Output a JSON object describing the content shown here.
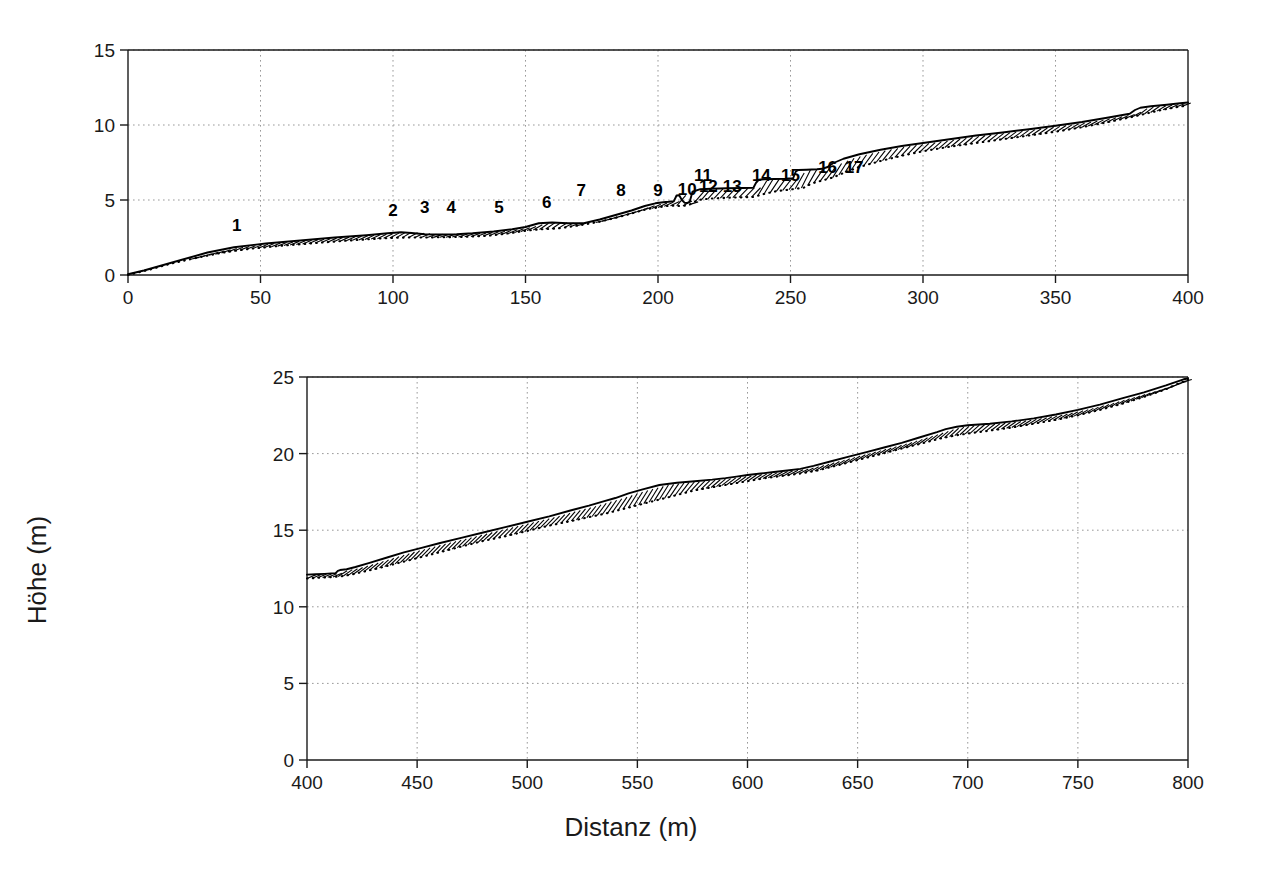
{
  "chart_data": [
    {
      "panel": "top",
      "type": "line",
      "title": "",
      "xlabel": "",
      "ylabel": "",
      "xlim": [
        0,
        400
      ],
      "ylim": [
        0,
        15
      ],
      "xticks": [
        0,
        50,
        100,
        150,
        200,
        250,
        300,
        350,
        400
      ],
      "xticklabels": [
        "0",
        "50",
        "100",
        "150",
        "200",
        "250",
        "300",
        "350",
        "400"
      ],
      "yticks": [
        0,
        5,
        10,
        15
      ],
      "yticklabels": [
        "0",
        "5",
        "10",
        "15"
      ],
      "grid": true,
      "series": [
        {
          "name": "surface-solid",
          "style": "solid",
          "x": [
            0,
            6,
            12,
            20,
            30,
            40,
            52,
            65,
            78,
            90,
            98,
            103,
            107,
            112,
            118,
            124,
            130,
            138,
            145,
            150,
            155,
            160,
            166,
            172,
            178,
            184,
            190,
            195,
            199,
            202,
            204,
            205,
            206,
            207,
            208,
            209,
            210,
            211,
            212,
            213,
            216,
            220,
            226,
            232,
            236,
            237,
            238,
            240,
            244,
            248,
            251,
            252,
            253,
            256,
            260,
            262,
            264,
            266,
            270,
            276,
            284,
            292,
            300,
            310,
            320,
            330,
            340,
            350,
            360,
            370,
            378,
            380,
            382,
            386,
            392,
            397,
            400
          ],
          "y": [
            0.05,
            0.3,
            0.6,
            1.0,
            1.5,
            1.85,
            2.1,
            2.3,
            2.5,
            2.65,
            2.78,
            2.85,
            2.8,
            2.72,
            2.7,
            2.72,
            2.78,
            2.9,
            3.05,
            3.2,
            3.45,
            3.5,
            3.45,
            3.45,
            3.7,
            4.0,
            4.3,
            4.6,
            4.78,
            4.85,
            4.88,
            4.9,
            4.92,
            5.3,
            5.32,
            5.0,
            4.82,
            4.8,
            4.9,
            5.55,
            5.72,
            5.75,
            5.78,
            5.8,
            5.82,
            6.15,
            6.35,
            6.38,
            6.4,
            6.42,
            6.45,
            6.9,
            7.0,
            7.02,
            7.05,
            7.08,
            7.2,
            7.45,
            7.75,
            8.05,
            8.35,
            8.6,
            8.8,
            9.05,
            9.3,
            9.5,
            9.72,
            9.95,
            10.2,
            10.5,
            10.75,
            11.0,
            11.15,
            11.25,
            11.35,
            11.45,
            11.5
          ]
        },
        {
          "name": "excavation-dotted",
          "style": "dotted",
          "x": [
            0,
            8,
            16,
            26,
            36,
            46,
            58,
            70,
            82,
            92,
            100,
            106,
            112,
            120,
            128,
            136,
            144,
            150,
            156,
            162,
            170,
            178,
            186,
            192,
            196,
            200,
            203,
            206,
            208,
            210,
            212,
            215,
            220,
            226,
            232,
            236,
            240,
            245,
            250,
            252,
            255,
            258,
            262,
            266,
            270,
            276,
            284,
            292,
            300,
            310,
            320,
            330,
            340,
            350,
            360,
            370,
            378,
            384,
            390,
            396,
            400
          ],
          "y": [
            0.0,
            0.35,
            0.75,
            1.15,
            1.5,
            1.75,
            1.95,
            2.12,
            2.28,
            2.4,
            2.48,
            2.5,
            2.5,
            2.52,
            2.55,
            2.62,
            2.78,
            2.95,
            3.05,
            3.1,
            3.3,
            3.55,
            3.9,
            4.2,
            4.4,
            4.5,
            4.6,
            4.62,
            4.6,
            4.62,
            4.7,
            5.0,
            5.1,
            5.15,
            5.18,
            5.2,
            5.4,
            5.6,
            5.7,
            5.75,
            5.82,
            6.1,
            6.3,
            6.5,
            6.8,
            7.2,
            7.6,
            7.95,
            8.25,
            8.55,
            8.8,
            9.05,
            9.3,
            9.55,
            9.85,
            10.2,
            10.5,
            10.75,
            11.0,
            11.2,
            11.3
          ]
        }
      ],
      "point_labels": [
        {
          "id": "1",
          "x": 41,
          "y": 2.95
        },
        {
          "id": "2",
          "x": 100,
          "y": 3.95
        },
        {
          "id": "3",
          "x": 112,
          "y": 4.15
        },
        {
          "id": "4",
          "x": 122,
          "y": 4.15
        },
        {
          "id": "5",
          "x": 140,
          "y": 4.15
        },
        {
          "id": "6",
          "x": 158,
          "y": 4.45
        },
        {
          "id": "7",
          "x": 171,
          "y": 5.3
        },
        {
          "id": "8",
          "x": 186,
          "y": 5.3
        },
        {
          "id": "9",
          "x": 200,
          "y": 5.3
        },
        {
          "id": "10",
          "x": 211,
          "y": 5.35
        },
        {
          "id": "11",
          "x": 217,
          "y": 6.3
        },
        {
          "id": "12",
          "x": 219,
          "y": 5.55
        },
        {
          "id": "13",
          "x": 228,
          "y": 5.55
        },
        {
          "id": "14",
          "x": 239,
          "y": 6.3
        },
        {
          "id": "15",
          "x": 250,
          "y": 6.3
        },
        {
          "id": "16",
          "x": 264,
          "y": 6.8
        },
        {
          "id": "17",
          "x": 274,
          "y": 6.8
        }
      ]
    },
    {
      "panel": "bottom",
      "type": "line",
      "title": "",
      "xlabel": "Distanz (m)",
      "ylabel": "Höhe (m)",
      "xlim": [
        400,
        800
      ],
      "ylim": [
        0,
        25
      ],
      "xticks": [
        400,
        450,
        500,
        550,
        600,
        650,
        700,
        750,
        800
      ],
      "xticklabels": [
        "400",
        "450",
        "500",
        "550",
        "600",
        "650",
        "700",
        "750",
        "800"
      ],
      "yticks": [
        0,
        5,
        10,
        15,
        20,
        25
      ],
      "yticklabels": [
        "0",
        "5",
        "10",
        "15",
        "20",
        "25"
      ],
      "grid": true,
      "series": [
        {
          "name": "surface-solid",
          "style": "solid",
          "x": [
            400,
            404,
            408,
            411,
            413,
            414,
            415,
            416,
            418,
            422,
            428,
            436,
            444,
            452,
            460,
            470,
            480,
            490,
            500,
            510,
            520,
            528,
            535,
            540,
            546,
            552,
            560,
            568,
            576,
            584,
            590,
            595,
            600,
            606,
            612,
            618,
            624,
            630,
            638,
            646,
            654,
            662,
            670,
            678,
            686,
            690,
            695,
            700,
            710,
            720,
            730,
            740,
            750,
            760,
            770,
            780,
            790,
            795,
            798,
            800
          ],
          "y": [
            12.1,
            12.12,
            12.15,
            12.18,
            12.2,
            12.35,
            12.4,
            12.42,
            12.45,
            12.6,
            12.85,
            13.2,
            13.55,
            13.85,
            14.15,
            14.5,
            14.85,
            15.2,
            15.55,
            15.9,
            16.3,
            16.6,
            16.9,
            17.1,
            17.4,
            17.65,
            17.95,
            18.1,
            18.2,
            18.3,
            18.4,
            18.5,
            18.6,
            18.7,
            18.8,
            18.9,
            19.0,
            19.2,
            19.5,
            19.8,
            20.1,
            20.4,
            20.7,
            21.05,
            21.4,
            21.6,
            21.75,
            21.85,
            21.95,
            22.1,
            22.3,
            22.55,
            22.85,
            23.2,
            23.6,
            24.0,
            24.45,
            24.7,
            24.85,
            24.9
          ]
        },
        {
          "name": "excavation-dotted",
          "style": "dotted",
          "x": [
            400,
            406,
            412,
            416,
            420,
            426,
            432,
            440,
            448,
            456,
            464,
            472,
            480,
            490,
            500,
            510,
            520,
            528,
            536,
            544,
            552,
            560,
            568,
            576,
            584,
            592,
            600,
            608,
            616,
            624,
            632,
            640,
            648,
            656,
            664,
            672,
            680,
            688,
            695,
            702,
            710,
            720,
            730,
            740,
            750,
            760,
            770,
            780,
            790,
            796,
            800
          ],
          "y": [
            11.85,
            11.9,
            11.95,
            12.0,
            12.1,
            12.3,
            12.5,
            12.8,
            13.1,
            13.4,
            13.7,
            14.0,
            14.3,
            14.6,
            14.95,
            15.3,
            15.6,
            15.85,
            16.1,
            16.4,
            16.7,
            17.0,
            17.3,
            17.6,
            17.8,
            18.0,
            18.2,
            18.4,
            18.55,
            18.7,
            18.9,
            19.2,
            19.5,
            19.8,
            20.1,
            20.4,
            20.7,
            21.0,
            21.2,
            21.35,
            21.5,
            21.7,
            21.95,
            22.2,
            22.5,
            22.85,
            23.25,
            23.7,
            24.2,
            24.6,
            24.8
          ]
        }
      ]
    }
  ],
  "axes": {
    "top": {
      "y_ticks": [
        "0",
        "5",
        "10",
        "15"
      ],
      "x_ticks": [
        "0",
        "50",
        "100",
        "150",
        "200",
        "250",
        "300",
        "350",
        "400"
      ]
    },
    "bottom": {
      "y_ticks": [
        "0",
        "5",
        "10",
        "15",
        "20",
        "25"
      ],
      "x_ticks": [
        "400",
        "450",
        "500",
        "550",
        "600",
        "650",
        "700",
        "750",
        "800"
      ],
      "x_axis_title": "Distanz (m)",
      "y_axis_title": "Höhe (m)"
    }
  },
  "colors": {
    "line": "#000000",
    "grid": "#999999",
    "axis": "#1a1a1a",
    "background": "#ffffff"
  }
}
